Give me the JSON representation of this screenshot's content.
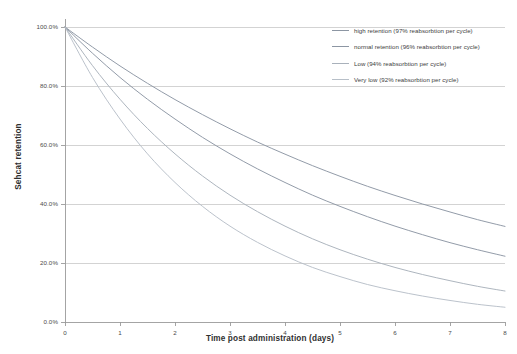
{
  "chart_data": {
    "type": "line",
    "title": "",
    "xlabel": "Time post administration (days)",
    "ylabel": "Sehcat retention",
    "xlim": [
      0,
      8
    ],
    "ylim": [
      0,
      1
    ],
    "grid": true,
    "legend_position": "top-right",
    "xticks": [
      "0",
      "1",
      "2",
      "3",
      "4",
      "5",
      "6",
      "7",
      "8"
    ],
    "xtick_values": [
      0,
      1,
      2,
      3,
      4,
      5,
      6,
      7,
      8
    ],
    "yticks": [
      "0.0%",
      "20.0%",
      "40.0%",
      "60.0%",
      "80.0%",
      "100.0%"
    ],
    "ytick_values": [
      0,
      0.2,
      0.4,
      0.6,
      0.8,
      1.0
    ],
    "x": [
      0,
      0.5,
      1,
      1.5,
      2,
      2.5,
      3,
      3.5,
      4,
      4.5,
      5,
      5.5,
      6,
      6.5,
      7,
      7.5,
      8
    ],
    "series": [
      {
        "name": "high retention (97% reabsorbtion per cycle)",
        "color": "#8c96a3",
        "reabsorption_per_cycle": 0.97,
        "values": [
          100.0,
          93.2,
          86.8,
          80.9,
          75.4,
          70.3,
          65.5,
          61.0,
          56.9,
          53.0,
          49.4,
          46.0,
          42.9,
          40.0,
          37.3,
          34.7,
          32.4
        ]
      },
      {
        "name": "normal retention (96% reabsorbtion per cycle)",
        "color": "#8c96a3",
        "reabsorption_per_cycle": 0.96,
        "values": [
          100.0,
          91.1,
          82.9,
          75.5,
          68.8,
          62.6,
          57.0,
          51.9,
          47.3,
          43.0,
          39.2,
          35.7,
          32.5,
          29.6,
          26.9,
          24.5,
          22.3
        ]
      },
      {
        "name": "Low (94% reabsorbtion per cycle)",
        "color": "#a9b1bb",
        "reabsorption_per_cycle": 0.94,
        "values": [
          100.0,
          86.9,
          75.5,
          65.6,
          57.0,
          49.5,
          43.0,
          37.4,
          32.5,
          28.2,
          24.5,
          21.3,
          18.5,
          16.1,
          14.0,
          12.1,
          10.5
        ]
      },
      {
        "name": "Very low (92% reabsorbtion per cycle)",
        "color": "#b7bfc8",
        "reabsorption_per_cycle": 0.92,
        "values": [
          100.0,
          82.9,
          68.8,
          57.0,
          47.3,
          39.2,
          32.5,
          27.0,
          22.4,
          18.5,
          15.4,
          12.7,
          10.6,
          8.8,
          7.3,
          6.0,
          5.0
        ]
      }
    ]
  },
  "legend": {
    "items": [
      {
        "label": "high retention (97% reabsorbtion per cycle)"
      },
      {
        "label": "normal retention (96% reabsorbtion per cycle)"
      },
      {
        "label": "Low (94% reabsorbtion per cycle)"
      },
      {
        "label": "Very low (92% reabsorbtion per cycle)"
      }
    ]
  },
  "axes": {
    "y_title": "Sehcat retention",
    "x_title": "Time post administration (days)",
    "y_labels": [
      "100.0%",
      "80.0%",
      "60.0%",
      "40.0%",
      "20.0%",
      "0.0%"
    ],
    "x_labels": [
      "0",
      "1",
      "2",
      "3",
      "4",
      "5",
      "6",
      "7",
      "8"
    ]
  },
  "colors": {
    "gridline": "#c8c8c8",
    "axis": "#9a9a9a",
    "series_dark": "#8c96a3",
    "series_light": "#b7bfc8",
    "text": "#3a3a3a",
    "background": "#ffffff"
  }
}
